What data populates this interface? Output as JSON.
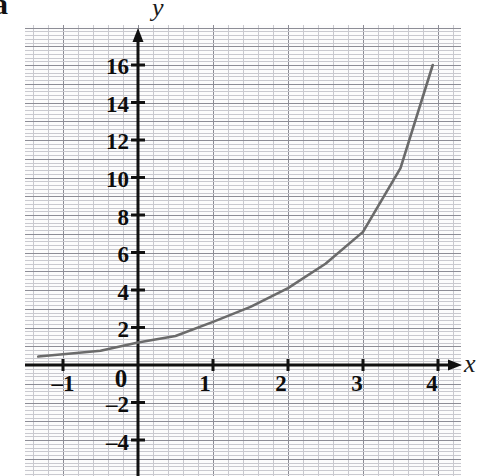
{
  "figure": {
    "part_label": "a",
    "background": "#ffffff",
    "paper_color": "#fcfcfc",
    "minor_grid_color": "#c9c9cf",
    "major_grid_color": "#8d8d96",
    "axis_color": "#111111",
    "curve_color": "#6b6b6b"
  },
  "chart_data": {
    "type": "line",
    "title": "",
    "subtitle": "",
    "xlabel": "x",
    "ylabel": "y",
    "grid": true,
    "legend": null,
    "annotations": [],
    "function": "y = 1.8^x",
    "xlim": [
      -1.5,
      4.45
    ],
    "ylim": [
      -5.2,
      17.8
    ],
    "x_ticks": [
      -1,
      0,
      1,
      2,
      3,
      4
    ],
    "x_tick_labels": [
      "-1",
      "0",
      "1",
      "2",
      "3",
      "4"
    ],
    "y_ticks": [
      -4,
      -2,
      2,
      4,
      6,
      8,
      10,
      12,
      14,
      16
    ],
    "y_tick_labels": [
      "-4",
      "-2",
      "2",
      "4",
      "6",
      "8",
      "10",
      "12",
      "14",
      "16"
    ],
    "minor_grid_step": 0.2,
    "major_grid_step": 1,
    "x": [
      -1.33,
      -1.0,
      -0.5,
      0.0,
      0.5,
      1.0,
      1.5,
      2.0,
      2.5,
      3.0,
      3.5,
      3.93
    ],
    "y": [
      0.45,
      0.57,
      0.76,
      1.2,
      1.55,
      2.3,
      3.1,
      4.1,
      5.4,
      7.1,
      10.5,
      16.0
    ],
    "series": [
      {
        "name": "y = 1.8^x",
        "x": [
          -1.33,
          -1.0,
          -0.5,
          0.0,
          0.5,
          1.0,
          1.5,
          2.0,
          2.5,
          3.0,
          3.5,
          3.93
        ],
        "values": [
          0.45,
          0.57,
          0.76,
          1.2,
          1.55,
          2.3,
          3.1,
          4.1,
          5.4,
          7.1,
          10.5,
          16.0
        ]
      }
    ]
  },
  "axes": {
    "y_labels": [
      {
        "text": "16",
        "top": 55
      },
      {
        "text": "14",
        "top": 93
      },
      {
        "text": "12",
        "top": 130
      },
      {
        "text": "10",
        "top": 168
      },
      {
        "text": "8",
        "top": 206
      },
      {
        "text": "6",
        "top": 243
      },
      {
        "text": "4",
        "top": 281
      },
      {
        "text": "2",
        "top": 318
      }
    ],
    "y_neg_labels": [
      {
        "text": "–2",
        "top": 393
      },
      {
        "text": "–4",
        "top": 431
      }
    ],
    "origin_label": "0",
    "x_neg_label": "–1",
    "x_labels": [
      {
        "text": "1",
        "left": 205
      },
      {
        "text": "2",
        "left": 281
      },
      {
        "text": "3",
        "left": 357
      },
      {
        "text": "4",
        "left": 432
      }
    ]
  }
}
